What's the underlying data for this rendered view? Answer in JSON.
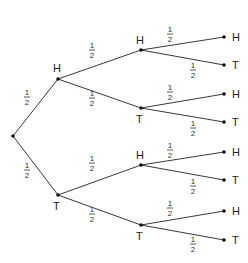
{
  "diagram": {
    "type": "probability-tree",
    "root": {
      "x": 13,
      "y": 136
    },
    "nodes": [
      {
        "id": "L1H",
        "label": "H",
        "x": 58,
        "y": 79,
        "lx": 53,
        "ly": 72
      },
      {
        "id": "L1T",
        "label": "T",
        "x": 58,
        "y": 195,
        "lx": 53,
        "ly": 210
      },
      {
        "id": "L2HH",
        "label": "H",
        "x": 141,
        "y": 50,
        "lx": 136,
        "ly": 44
      },
      {
        "id": "L2HT",
        "label": "T",
        "x": 141,
        "y": 108,
        "lx": 136,
        "ly": 123
      },
      {
        "id": "L2TH",
        "label": "H",
        "x": 141,
        "y": 165,
        "lx": 136,
        "ly": 159
      },
      {
        "id": "L2TT",
        "label": "T",
        "x": 141,
        "y": 225,
        "lx": 136,
        "ly": 240
      },
      {
        "id": "L3HHH",
        "label": "H",
        "x": 224,
        "y": 37,
        "lx": 232,
        "ly": 41
      },
      {
        "id": "L3HHT",
        "label": "T",
        "x": 224,
        "y": 65,
        "lx": 232,
        "ly": 69
      },
      {
        "id": "L3HTH",
        "label": "H",
        "x": 224,
        "y": 94,
        "lx": 232,
        "ly": 98
      },
      {
        "id": "L3HTT",
        "label": "T",
        "x": 224,
        "y": 122,
        "lx": 232,
        "ly": 126
      },
      {
        "id": "L3THH",
        "label": "H",
        "x": 224,
        "y": 152,
        "lx": 232,
        "ly": 156
      },
      {
        "id": "L3THT",
        "label": "T",
        "x": 224,
        "y": 180,
        "lx": 232,
        "ly": 184
      },
      {
        "id": "L3TTH",
        "label": "H",
        "x": 224,
        "y": 211,
        "lx": 232,
        "ly": 215
      },
      {
        "id": "L3TTT",
        "label": "T",
        "x": 224,
        "y": 240,
        "lx": 232,
        "ly": 244
      }
    ],
    "edges": [
      {
        "from": "root",
        "to": "L1H",
        "prob_num": "1",
        "prob_den": "2",
        "px": 27,
        "py": 97
      },
      {
        "from": "root",
        "to": "L1T",
        "prob_num": "1",
        "prob_den": "2",
        "px": 27,
        "py": 170
      },
      {
        "from": "L1H",
        "to": "L2HH",
        "prob_num": "1",
        "prob_den": "2",
        "px": 92,
        "py": 50
      },
      {
        "from": "L1H",
        "to": "L2HT",
        "prob_num": "1",
        "prob_den": "2",
        "px": 92,
        "py": 98
      },
      {
        "from": "L1T",
        "to": "L2TH",
        "prob_num": "1",
        "prob_den": "2",
        "px": 92,
        "py": 163
      },
      {
        "from": "L1T",
        "to": "L2TT",
        "prob_num": "1",
        "prob_den": "2",
        "px": 92,
        "py": 214
      },
      {
        "from": "L2HH",
        "to": "L3HHH",
        "prob_num": "1",
        "prob_den": "2",
        "px": 170,
        "py": 34
      },
      {
        "from": "L2HH",
        "to": "L3HHT",
        "prob_num": "1",
        "prob_den": "2",
        "px": 193,
        "py": 70
      },
      {
        "from": "L2HT",
        "to": "L3HTH",
        "prob_num": "1",
        "prob_den": "2",
        "px": 170,
        "py": 92
      },
      {
        "from": "L2HT",
        "to": "L3HTT",
        "prob_num": "1",
        "prob_den": "2",
        "px": 193,
        "py": 128
      },
      {
        "from": "L2TH",
        "to": "L3THH",
        "prob_num": "1",
        "prob_den": "2",
        "px": 170,
        "py": 150
      },
      {
        "from": "L2TH",
        "to": "L3THT",
        "prob_num": "1",
        "prob_den": "2",
        "px": 193,
        "py": 186
      },
      {
        "from": "L2TT",
        "to": "L3TTH",
        "prob_num": "1",
        "prob_den": "2",
        "px": 170,
        "py": 208
      },
      {
        "from": "L2TT",
        "to": "L3TTT",
        "prob_num": "1",
        "prob_den": "2",
        "px": 193,
        "py": 244
      }
    ]
  }
}
